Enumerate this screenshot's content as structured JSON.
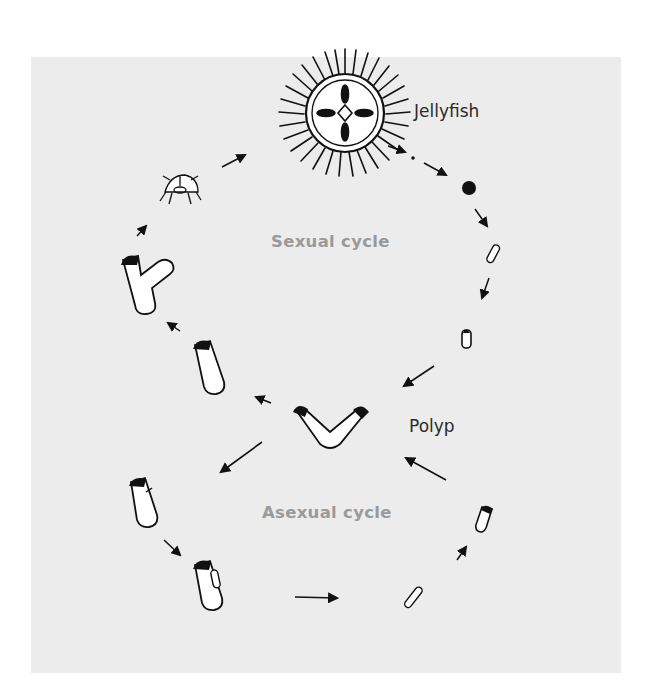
{
  "diagram": {
    "background_color": "#ececec",
    "labels": {
      "jellyfish": "Jellyfish",
      "sexual_cycle": "Sexual cycle",
      "polyp": "Polyp",
      "asexual_cycle": "Asexual cycle"
    },
    "label_colors": {
      "stage_label": "#2a2a2a",
      "cycle_label": "#9a9a9a"
    },
    "stages": {
      "sexual_cycle": [
        "adult-medusa",
        "gamete",
        "fertilized-egg",
        "planula-larva",
        "settled-larva",
        "polyp"
      ],
      "asexual_cycle": [
        "polyp",
        "detaching-bud",
        "budding-polyp",
        "free-bud",
        "young-polyp",
        "polyp"
      ],
      "strobilation": [
        "polyp",
        "single-polyp",
        "branching-polyp",
        "ephyra",
        "adult-medusa"
      ]
    }
  }
}
